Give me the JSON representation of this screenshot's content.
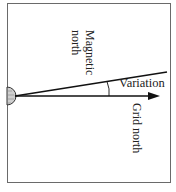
{
  "diagram": {
    "labels": {
      "magnetic_north": [
        "Magnetic",
        "north"
      ],
      "variation": "Variation",
      "grid_north": "Grid north"
    },
    "elements": {
      "origin_symbol": "half-circle",
      "grid_north_line": "arrow",
      "magnetic_north_line": "line",
      "variation_arc": "angle-arc"
    },
    "colors": {
      "line": "#111111",
      "frame": "#6a6a6a",
      "symbol_fill": "#bdbdbd"
    }
  }
}
